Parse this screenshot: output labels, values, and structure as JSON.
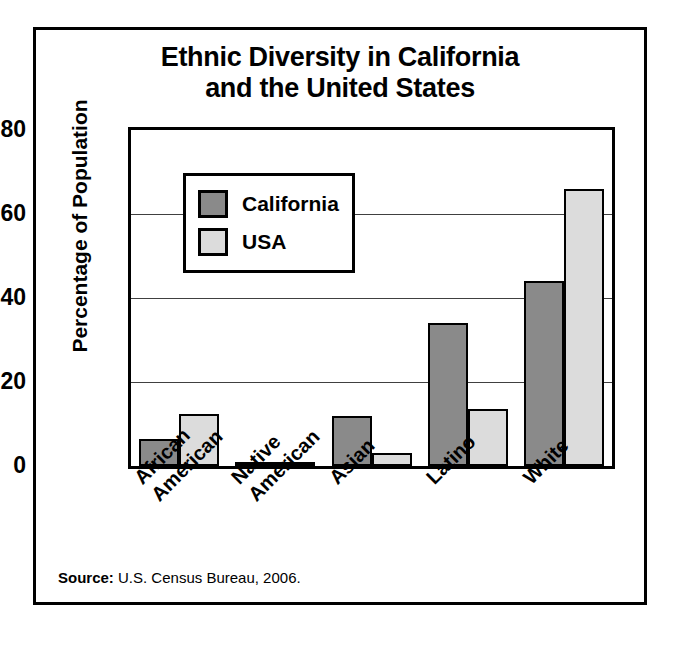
{
  "figure": {
    "title_line1": "Ethnic Diversity in California",
    "title_line2": "and the United States",
    "source_label": "Source:",
    "source_text": "U.S. Census Bureau, 2006."
  },
  "legend": {
    "position": "inside-top-left",
    "items": [
      {
        "label": "California",
        "color": "#8a8a8a"
      },
      {
        "label": "USA",
        "color": "#dcdcdc"
      }
    ]
  },
  "axis": {
    "y_title": "Percentage of Population",
    "y_ticks": [
      "0",
      "20",
      "40",
      "60",
      "80"
    ]
  },
  "chart_data": {
    "type": "bar",
    "title": "Ethnic Diversity in California and the United States",
    "xlabel": "",
    "ylabel": "Percentage of Population",
    "ylim": [
      0,
      80
    ],
    "yticks": [
      0,
      20,
      40,
      60,
      80
    ],
    "grid": "horizontal-at-20-40-60",
    "legend_position": "upper left (inside plot)",
    "categories": [
      "African American",
      "Native American",
      "Asian",
      "Latino",
      "White"
    ],
    "category_lines": [
      [
        "African",
        "American"
      ],
      [
        "Native",
        "American"
      ],
      [
        "Asian",
        ""
      ],
      [
        "Latino",
        ""
      ],
      [
        "White",
        ""
      ]
    ],
    "series": [
      {
        "name": "California",
        "color": "#8a8a8a",
        "values": [
          6.5,
          1,
          12,
          34,
          44
        ]
      },
      {
        "name": "USA",
        "color": "#dcdcdc",
        "values": [
          12.5,
          1,
          3,
          13.5,
          66
        ]
      }
    ],
    "annotations": [
      "Source: U.S. Census Bureau, 2006."
    ]
  }
}
